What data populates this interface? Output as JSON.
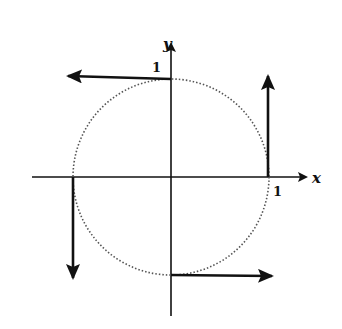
{
  "diagram": {
    "type": "unit-circle-with-tangent-vectors",
    "axes": {
      "x_label": "x",
      "y_label": "y"
    },
    "ticks": {
      "x_tick_label": "1",
      "y_tick_label": "1"
    },
    "circle": {
      "style": "dotted",
      "radius_units": 1
    },
    "vectors": [
      {
        "at": "(0,1)",
        "direction": "left"
      },
      {
        "at": "(1,0)",
        "direction": "up"
      },
      {
        "at": "(-1,0)",
        "direction": "down"
      },
      {
        "at": "(0,-1)",
        "direction": "right"
      }
    ],
    "colors": {
      "ink": "#111111",
      "circle": "#555555",
      "background": "#ffffff"
    }
  }
}
